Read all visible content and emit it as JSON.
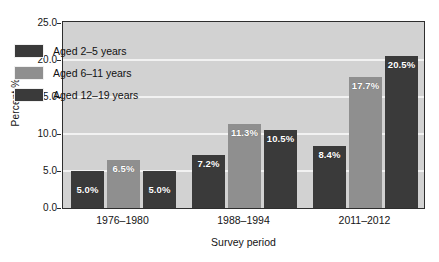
{
  "chart_data": {
    "type": "bar",
    "title": "",
    "subtitle": "",
    "xlabel": "Survey period",
    "ylabel": "Percent %",
    "categories": [
      "1976–1980",
      "1988–1994",
      "2011–2012"
    ],
    "series": [
      {
        "name": "Aged 2–5 years",
        "color": "#3a3a3a",
        "values": [
          5.0,
          7.2,
          8.4
        ],
        "labels": [
          "5.0%",
          "7.2%",
          "8.4%"
        ]
      },
      {
        "name": "Aged 6–11 years",
        "color": "#8f8f8f",
        "values": [
          6.5,
          11.3,
          17.7
        ],
        "labels": [
          "6.5%",
          "11.3%",
          "17.7%"
        ]
      },
      {
        "name": "Aged 12–19 years",
        "color": "#3a3a3a",
        "values": [
          5.0,
          10.5,
          20.5
        ],
        "labels": [
          "5.0%",
          "10.5%",
          "20.5%"
        ]
      }
    ],
    "ylim": [
      0.0,
      25.0
    ],
    "ytick_values": [
      0.0,
      5.0,
      10.0,
      15.0,
      20.0,
      25.0
    ],
    "ytick_labels": [
      "0.0",
      "5.0",
      "10.0",
      "15.0",
      "20.0",
      "25.0"
    ],
    "grid": "horizontal-white",
    "legend_position": "upper-left-inside",
    "plot_background": "#d2d2d2",
    "gridline_color": "#f2f2f2",
    "axis_color": "#2e2e2e"
  },
  "legend": {
    "items": [
      {
        "label": "Aged 2–5 years",
        "swatch": "dark"
      },
      {
        "label": "Aged 6–11 years",
        "swatch": "light"
      },
      {
        "label": "Aged 12–19 years",
        "swatch": "dark"
      }
    ]
  },
  "axes": {
    "y_title": "Percent %",
    "x_title": "Survey period"
  }
}
